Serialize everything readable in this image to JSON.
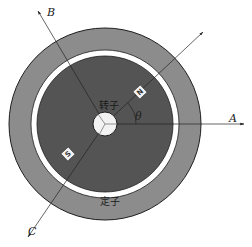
{
  "diagram": {
    "center": {
      "x": 105,
      "y": 124
    },
    "colors": {
      "stator": "#8c8c8c",
      "air_gap": "#ffffff",
      "rotor": "#545454",
      "hub": "#f2f2f2",
      "axis_line": "#222222",
      "outline": "#1e1e1e"
    },
    "labels": {
      "stator": "定子",
      "rotor": "转子",
      "angle": "θ",
      "axis_a": "A",
      "axis_b": "B",
      "axis_c": "C",
      "pole_north": "N",
      "pole_south": "S"
    }
  }
}
